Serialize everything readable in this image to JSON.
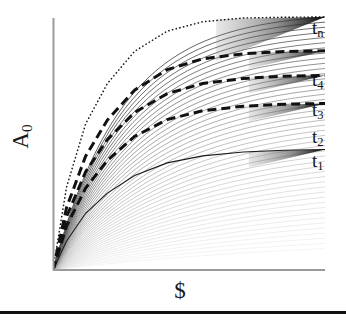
{
  "figure": {
    "xlabel": "$",
    "ylabel_base": "A",
    "ylabel_sub": "0",
    "ylabel": "A0"
  },
  "chart_data": {
    "type": "line",
    "title": "",
    "subtitle": "",
    "xlabel": "$",
    "ylabel": "A_0",
    "grid": false,
    "legend_position": "right-inline",
    "axis_origin": {
      "x": 53,
      "y": 270
    },
    "axis_extent": {
      "x_max": 325,
      "y_min": 18
    },
    "xlim": [
      0,
      1
    ],
    "ylim": [
      0,
      1
    ],
    "axis_ticks": {
      "x": [],
      "y": []
    },
    "annotations": [
      {
        "label": "t_n",
        "text": "t",
        "sub": "n",
        "x": 318,
        "y": 28
      },
      {
        "label": "t_4",
        "text": "t",
        "sub": "4",
        "x": 318,
        "y": 80
      },
      {
        "label": "t_3",
        "text": "t",
        "sub": "3",
        "x": 318,
        "y": 110
      },
      {
        "label": "t_2",
        "text": "t",
        "sub": "2",
        "x": 318,
        "y": 137
      },
      {
        "label": "t_1",
        "text": "t",
        "sub": "1",
        "x": 318,
        "y": 161
      }
    ],
    "series": [
      {
        "name": "t_1",
        "style": "solid-thin",
        "color": "#1a1a1a",
        "width": 1.1,
        "x": [
          0,
          0.05,
          0.12,
          0.2,
          0.3,
          0.42,
          0.55,
          0.7,
          0.85,
          1.0
        ],
        "values": [
          0,
          0.115,
          0.225,
          0.305,
          0.375,
          0.425,
          0.453,
          0.468,
          0.475,
          0.478
        ]
      },
      {
        "name": "t_2",
        "style": "dashed-thick",
        "color": "#111111",
        "width": 3.0,
        "x": [
          0,
          0.05,
          0.12,
          0.2,
          0.3,
          0.42,
          0.55,
          0.7,
          0.85,
          1.0
        ],
        "values": [
          0,
          0.175,
          0.325,
          0.435,
          0.53,
          0.597,
          0.632,
          0.65,
          0.658,
          0.661
        ]
      },
      {
        "name": "t_3",
        "style": "dashed-thick",
        "color": "#111111",
        "width": 3.0,
        "x": [
          0,
          0.05,
          0.12,
          0.2,
          0.3,
          0.42,
          0.55,
          0.7,
          0.85,
          1.0
        ],
        "values": [
          0,
          0.212,
          0.39,
          0.518,
          0.625,
          0.7,
          0.74,
          0.76,
          0.769,
          0.772
        ]
      },
      {
        "name": "t_4",
        "style": "dashed-thick",
        "color": "#111111",
        "width": 3.0,
        "x": [
          0,
          0.05,
          0.12,
          0.2,
          0.3,
          0.42,
          0.55,
          0.7,
          0.85,
          1.0
        ],
        "values": [
          0,
          0.248,
          0.452,
          0.595,
          0.714,
          0.795,
          0.838,
          0.858,
          0.867,
          0.87
        ]
      },
      {
        "name": "t_n",
        "style": "dotted-fine",
        "color": "#111111",
        "width": 1.4,
        "x": [
          0,
          0.05,
          0.12,
          0.2,
          0.3,
          0.42,
          0.55,
          0.7,
          0.85,
          1.0
        ],
        "values": [
          0,
          0.33,
          0.58,
          0.74,
          0.868,
          0.948,
          0.985,
          1.0,
          1.003,
          1.004
        ]
      }
    ],
    "fan": {
      "count": 46,
      "description": "Thin gray concave curves from origin, saturation increasing across the fan",
      "color_light": "#d8d8d8",
      "color_dark": "#3a3a3a"
    }
  },
  "colors": {
    "axis": "#9a9a9a",
    "curve": "#111111",
    "rule": "#111111",
    "background": "#ffffff"
  }
}
